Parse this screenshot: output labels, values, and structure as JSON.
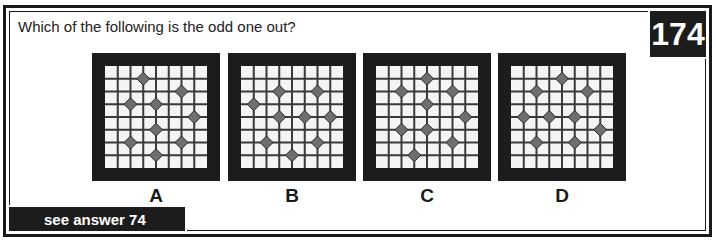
{
  "question": "Which of the following is the odd one out?",
  "puzzle_number": "174",
  "answer_link": "see answer 74",
  "colors": {
    "frame": "#1c1c1c",
    "board": "#f4f4f4",
    "gridline": "#3a3a3a",
    "diamond": "#6e6e6e"
  },
  "grid": {
    "cells": 8,
    "internal_lines": 7
  },
  "options": [
    {
      "label": "A",
      "diamonds": [
        [
          3,
          1
        ],
        [
          6,
          2
        ],
        [
          2,
          3
        ],
        [
          4,
          3
        ],
        [
          7,
          4
        ],
        [
          4,
          5
        ],
        [
          2,
          6
        ],
        [
          6,
          6
        ],
        [
          4,
          7
        ]
      ]
    },
    {
      "label": "B",
      "diamonds": [
        [
          3,
          2
        ],
        [
          6,
          2
        ],
        [
          1,
          3
        ],
        [
          3,
          4
        ],
        [
          5,
          4
        ],
        [
          7,
          4
        ],
        [
          2,
          6
        ],
        [
          6,
          6
        ],
        [
          4,
          7
        ]
      ]
    },
    {
      "label": "C",
      "diamonds": [
        [
          4,
          1
        ],
        [
          2,
          2
        ],
        [
          6,
          2
        ],
        [
          4,
          3
        ],
        [
          7,
          4
        ],
        [
          2,
          5
        ],
        [
          4,
          5
        ],
        [
          6,
          6
        ],
        [
          3,
          7
        ]
      ]
    },
    {
      "label": "D",
      "diamonds": [
        [
          4,
          1
        ],
        [
          2,
          2
        ],
        [
          6,
          2
        ],
        [
          1,
          4
        ],
        [
          3,
          4
        ],
        [
          5,
          4
        ],
        [
          7,
          5
        ],
        [
          2,
          6
        ],
        [
          5,
          6
        ]
      ]
    }
  ]
}
